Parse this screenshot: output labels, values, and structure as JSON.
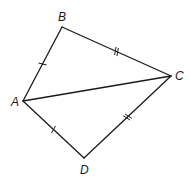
{
  "diagram": {
    "type": "quadrilateral-kite",
    "vertices": [
      {
        "name": "A",
        "x": 23,
        "y": 101,
        "label": "A",
        "lx": 11,
        "ly": 106
      },
      {
        "name": "B",
        "x": 62,
        "y": 27,
        "label": "B",
        "lx": 58,
        "ly": 21
      },
      {
        "name": "C",
        "x": 171,
        "y": 76,
        "label": "C",
        "lx": 175,
        "ly": 80
      },
      {
        "name": "D",
        "x": 84,
        "y": 158,
        "label": "D",
        "lx": 80,
        "ly": 174
      }
    ],
    "edges": [
      {
        "from": "A",
        "to": "B",
        "ticks": 1
      },
      {
        "from": "B",
        "to": "C",
        "ticks": 2
      },
      {
        "from": "C",
        "to": "D",
        "ticks": 2
      },
      {
        "from": "D",
        "to": "A",
        "ticks": 1
      },
      {
        "from": "A",
        "to": "C",
        "ticks": 0
      }
    ],
    "labels": {
      "A": "A",
      "B": "B",
      "C": "C",
      "D": "D"
    },
    "color": "#1a1a1a"
  }
}
